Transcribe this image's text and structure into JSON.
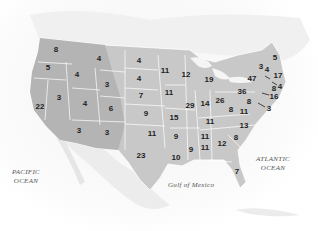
{
  "map": {
    "type": "choropleth-labels",
    "subject": "United States electoral votes by state",
    "labels": {
      "pacific": "PACIFIC OCEAN",
      "pacific_line1": "PACIFIC",
      "pacific_line2": "OCEAN",
      "atlantic_line1": "ATLANTIC",
      "atlantic_line2": "OCEAN",
      "gulf": "Gulf of Mexico"
    },
    "states": [
      {
        "state": "Washington",
        "value": "8",
        "x": 56,
        "y": 50
      },
      {
        "state": "Oregon",
        "value": "5",
        "x": 48,
        "y": 68
      },
      {
        "state": "California",
        "value": "22",
        "x": 40,
        "y": 107
      },
      {
        "state": "Idaho",
        "value": "4",
        "x": 77,
        "y": 75
      },
      {
        "state": "Nevada",
        "value": "3",
        "x": 59,
        "y": 98
      },
      {
        "state": "Montana",
        "value": "4",
        "x": 99,
        "y": 59
      },
      {
        "state": "Wyoming",
        "value": "3",
        "x": 107,
        "y": 85
      },
      {
        "state": "Utah",
        "value": "4",
        "x": 85,
        "y": 104
      },
      {
        "state": "Colorado",
        "value": "6",
        "x": 111,
        "y": 109
      },
      {
        "state": "Arizona",
        "value": "3",
        "x": 79,
        "y": 131
      },
      {
        "state": "New Mexico",
        "value": "3",
        "x": 107,
        "y": 133
      },
      {
        "state": "North Dakota",
        "value": "4",
        "x": 139,
        "y": 61
      },
      {
        "state": "South Dakota",
        "value": "4",
        "x": 139,
        "y": 79
      },
      {
        "state": "Nebraska",
        "value": "7",
        "x": 141,
        "y": 96
      },
      {
        "state": "Kansas",
        "value": "9",
        "x": 146,
        "y": 114
      },
      {
        "state": "Oklahoma",
        "value": "11",
        "x": 152,
        "y": 134
      },
      {
        "state": "Texas",
        "value": "23",
        "x": 141,
        "y": 156
      },
      {
        "state": "Minnesota",
        "value": "11",
        "x": 165,
        "y": 71
      },
      {
        "state": "Iowa",
        "value": "11",
        "x": 169,
        "y": 93
      },
      {
        "state": "Missouri",
        "value": "15",
        "x": 174,
        "y": 118
      },
      {
        "state": "Arkansas",
        "value": "9",
        "x": 176,
        "y": 137
      },
      {
        "state": "Louisiana",
        "value": "10",
        "x": 176,
        "y": 158
      },
      {
        "state": "Wisconsin",
        "value": "12",
        "x": 186,
        "y": 75
      },
      {
        "state": "Illinois",
        "value": "29",
        "x": 190,
        "y": 106
      },
      {
        "state": "Michigan",
        "value": "19",
        "x": 209,
        "y": 80
      },
      {
        "state": "Indiana",
        "value": "14",
        "x": 205,
        "y": 104
      },
      {
        "state": "Ohio",
        "value": "26",
        "x": 220,
        "y": 101
      },
      {
        "state": "Kentucky",
        "value": "11",
        "x": 210,
        "y": 122
      },
      {
        "state": "Tennessee",
        "value": "11",
        "x": 205,
        "y": 137
      },
      {
        "state": "Mississippi",
        "value": "9",
        "x": 191,
        "y": 150
      },
      {
        "state": "Alabama",
        "value": "11",
        "x": 205,
        "y": 148
      },
      {
        "state": "Georgia",
        "value": "12",
        "x": 222,
        "y": 144
      },
      {
        "state": "Florida",
        "value": "7",
        "x": 237,
        "y": 172
      },
      {
        "state": "South Carolina",
        "value": "8",
        "x": 236,
        "y": 138
      },
      {
        "state": "North Carolina",
        "value": "13",
        "x": 244,
        "y": 126
      },
      {
        "state": "Virginia",
        "value": "11",
        "x": 244,
        "y": 112
      },
      {
        "state": "West Virginia",
        "value": "8",
        "x": 231,
        "y": 110
      },
      {
        "state": "Pennsylvania",
        "value": "36",
        "x": 242,
        "y": 92
      },
      {
        "state": "New York",
        "value": "47",
        "x": 252,
        "y": 79
      },
      {
        "state": "Maryland",
        "value": "8",
        "x": 249,
        "y": 102
      },
      {
        "state": "Vermont",
        "value": "3",
        "x": 261,
        "y": 67
      },
      {
        "state": "New Hampshire",
        "value": "4",
        "x": 267,
        "y": 70
      },
      {
        "state": "Maine",
        "value": "5",
        "x": 275,
        "y": 58
      },
      {
        "state": "Massachusetts",
        "value": "17",
        "x": 278,
        "y": 76
      },
      {
        "state": "Rhode Island",
        "value": "4",
        "x": 280,
        "y": 87
      },
      {
        "state": "Connecticut",
        "value": "8",
        "x": 274,
        "y": 89
      },
      {
        "state": "New Jersey",
        "value": "16",
        "x": 274,
        "y": 97
      },
      {
        "state": "Delaware",
        "value": "3",
        "x": 269,
        "y": 109
      }
    ]
  }
}
